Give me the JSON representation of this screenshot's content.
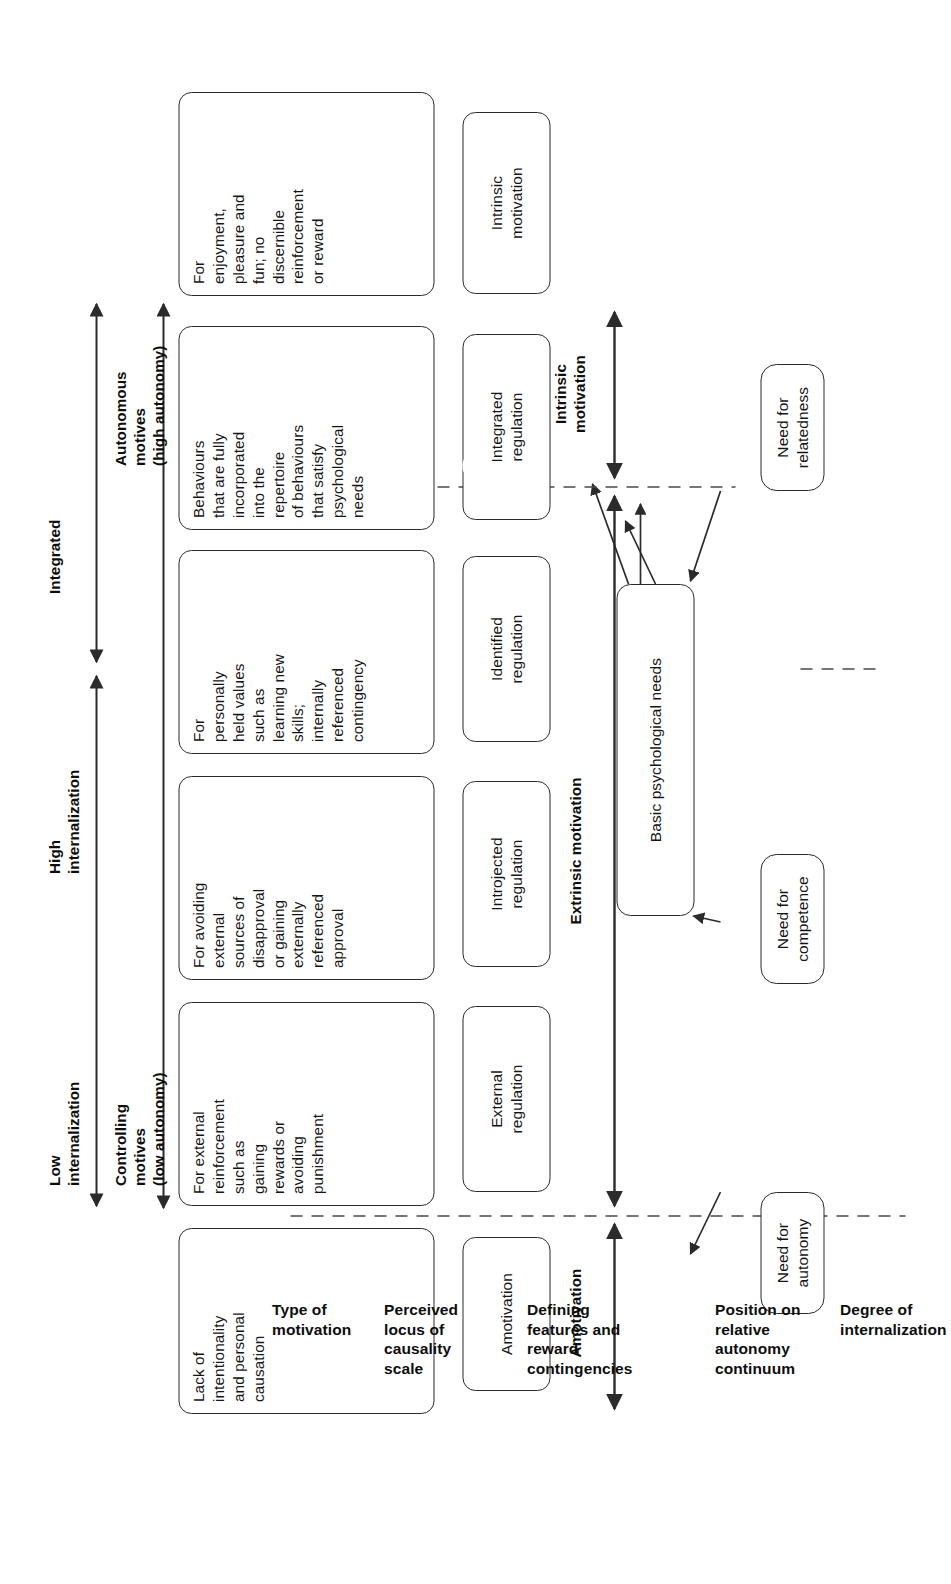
{
  "figure": {
    "orientation": "rotated-90-ccw",
    "line_color": "#2b2b2b"
  },
  "needs": {
    "autonomy": "Need for\nautonomy",
    "competence": "Need for\ncompetence",
    "relatedness": "Need for\nrelatedness",
    "basic": "Basic psychological needs"
  },
  "row_labels": {
    "type_of_motivation": "Type of\nmotivation",
    "perceived_locus": "Perceived\nlocus of\ncausality\nscale",
    "defining_features": "Defining\nfeatures and\nreward\ncontingencies",
    "position_on_continuum": "Position on\nrelative\nautonomy\ncontinuum",
    "degree_of_internalization": "Degree of\ninternalization"
  },
  "motivation_types": {
    "intrinsic": "Intrinsic\nmotivation",
    "extrinsic": "Extrinsic motivation",
    "amotivation": "Amotivation"
  },
  "regulations": [
    {
      "key": "intrinsic-motivation",
      "label": "Intrinsic\nmotivation"
    },
    {
      "key": "integrated-regulation",
      "label": "Integrated\nregulation"
    },
    {
      "key": "identified-regulation",
      "label": "Identified\nregulation"
    },
    {
      "key": "introjected-regulation",
      "label": "Introjected\nregulation"
    },
    {
      "key": "external-regulation",
      "label": "External\nregulation"
    },
    {
      "key": "amotivation",
      "label": "Amotivation"
    }
  ],
  "descriptions": [
    {
      "key": "intrinsic-motivation",
      "text": "For\nenjoyment,\npleasure and\nfun; no\ndiscernible\nreinforcement\nor reward"
    },
    {
      "key": "integrated-regulation",
      "text": "Behaviours\nthat are fully\nincorporated\ninto the\nrepertoire\nof behaviours\nthat satisfy\npsychological\nneeds"
    },
    {
      "key": "identified-regulation",
      "text": "For\npersonally\nheld values\nsuch as\nlearning new\nskills;\ninternally\nreferenced\ncontingency"
    },
    {
      "key": "introjected-regulation",
      "text": "For avoiding\nexternal\nsources of\ndisapproval\nor gaining\nexternally\nreferenced\napproval"
    },
    {
      "key": "external-regulation",
      "text": "For external\nreinforcement\nsuch as\ngaining\nrewards or\navoiding\npunishment"
    },
    {
      "key": "amotivation",
      "text": "Lack of\nintentionality\nand personal\ncausation"
    }
  ],
  "autonomy_continuum": {
    "left": "Autonomous\nmotives\n(high autonomy)",
    "right": "Controlling\nmotives\n(low autonomy)"
  },
  "internalization": {
    "integrated": "Integrated",
    "high": "High\ninternalization",
    "low": "Low\ninternalization"
  }
}
